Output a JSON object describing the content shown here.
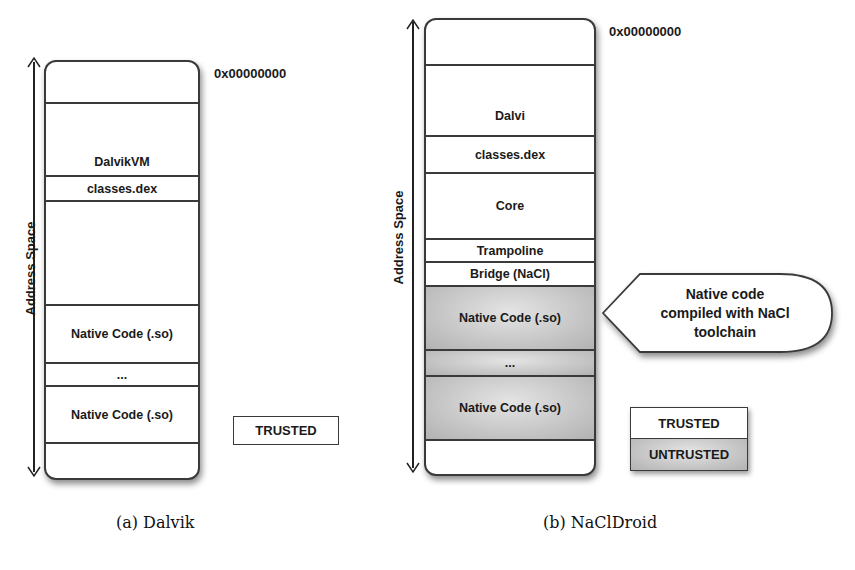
{
  "figure_a": {
    "caption": "(a) Dalvik",
    "axis_label": "Address Space",
    "address_label": "0x00000000",
    "segments": [
      {
        "label": "",
        "trust": "trusted"
      },
      {
        "label": "DalvikVM",
        "trust": "trusted"
      },
      {
        "label": "classes.dex",
        "trust": "trusted"
      },
      {
        "label": "",
        "trust": "trusted"
      },
      {
        "label": "Native Code (.so)",
        "trust": "trusted"
      },
      {
        "label": "...",
        "trust": "trusted"
      },
      {
        "label": "Native Code (.so)",
        "trust": "trusted"
      },
      {
        "label": "",
        "trust": "trusted"
      }
    ],
    "legend": [
      {
        "label": "TRUSTED",
        "color": "#ffffff"
      }
    ]
  },
  "figure_b": {
    "caption": "(b) NaClDroid",
    "axis_label": "Address Space",
    "address_label": "0x00000000",
    "segments": [
      {
        "label": "",
        "trust": "trusted"
      },
      {
        "label": "Dalvi",
        "trust": "trusted"
      },
      {
        "label": "classes.dex",
        "trust": "trusted"
      },
      {
        "label": "Core",
        "trust": "trusted"
      },
      {
        "label": "Trampoline",
        "trust": "trusted"
      },
      {
        "label": "Bridge (NaCl)",
        "trust": "trusted"
      },
      {
        "label": "Native Code (.so)",
        "trust": "untrusted"
      },
      {
        "label": "...",
        "trust": "untrusted"
      },
      {
        "label": "Native Code (.so)",
        "trust": "untrusted"
      },
      {
        "label": "",
        "trust": "trusted"
      }
    ],
    "callout": {
      "line1": "Native code",
      "line2": "compiled with NaCl",
      "line3": "toolchain"
    },
    "legend": [
      {
        "label": "TRUSTED",
        "color": "#ffffff"
      },
      {
        "label": "UNTRUSTED",
        "color": "#c4c4c4"
      }
    ]
  }
}
